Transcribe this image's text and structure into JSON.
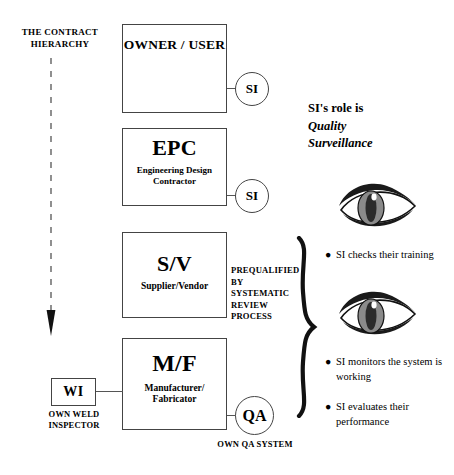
{
  "diagram": {
    "caption": "THE CONTRACT HIERARCHY",
    "boxes": [
      {
        "id": "owner",
        "title": "OWNER / USER",
        "subtitle": ""
      },
      {
        "id": "epc",
        "title": "EPC",
        "subtitle": "Engineering Design Contractor"
      },
      {
        "id": "sv",
        "title": "S/V",
        "subtitle": "Supplier/Vendor"
      },
      {
        "id": "mf",
        "title": "M/F",
        "subtitle": "Manufacturer/ Fabricator"
      }
    ],
    "wi": {
      "label": "WI",
      "caption": "OWN WELD INSPECTOR"
    },
    "circles": [
      {
        "id": "si1",
        "label": "SI",
        "caption": ""
      },
      {
        "id": "si2",
        "label": "SI",
        "caption": ""
      },
      {
        "id": "qa",
        "label": "QA",
        "caption": "OWN QA SYSTEM"
      }
    ],
    "prequalified_note": "PREQUALIFIED BY SYSTEMATIC REVIEW PROCESS",
    "role_note": {
      "line1": "SI's role is",
      "line2": "Quality",
      "line3": "Surveillance"
    },
    "bullets": [
      {
        "id": "checks",
        "text": "SI checks their training"
      },
      {
        "id": "monitors",
        "text": "SI monitors the system is working"
      },
      {
        "id": "evaluates",
        "text": "SI evaluates their performance"
      }
    ],
    "colors": {
      "background": "#ffffff",
      "ink": "#000000",
      "stroke": "#444444",
      "eye_dark": "#1a1a1a",
      "eye_iris": "#8a8a8a"
    }
  }
}
